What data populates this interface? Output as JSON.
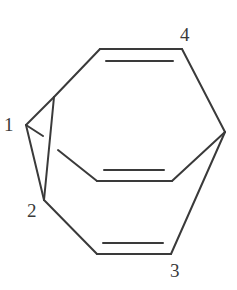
{
  "diagram": {
    "type": "chemical-structure",
    "labels": {
      "atom1": "1",
      "atom2": "2",
      "atom3": "3",
      "atom4": "4"
    },
    "stroke_color": "#3a3a3a",
    "background_color": "#ffffff",
    "double_bonds": [
      "top",
      "middle",
      "bottom"
    ]
  }
}
